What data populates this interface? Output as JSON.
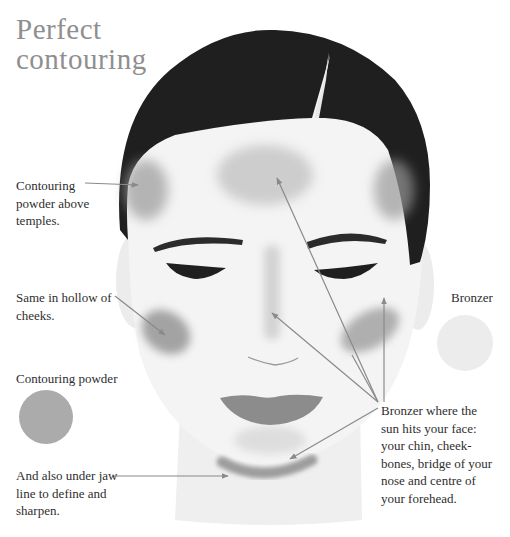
{
  "title": {
    "line1": "Perfect",
    "line2": "contouring"
  },
  "labels": {
    "temples": [
      "Contouring",
      "powder above",
      "temples."
    ],
    "cheeks": [
      "Same in hollow of",
      "cheeks."
    ],
    "contouring_swatch": "Contouring powder",
    "jaw": [
      "And also under jaw",
      "line to define and",
      "sharpen."
    ],
    "bronzer_swatch": "Bronzer",
    "bronzer_areas": [
      "Bronzer where the",
      "sun hits your face:",
      "your chin, cheek-",
      "bones, bridge of your",
      "nose and centre of",
      "your forehead."
    ]
  },
  "colors": {
    "hair": "#1f1f1f",
    "skin": "#f2f2f2",
    "contour": "#9a9a9a",
    "bronzer": "#d4d4d4",
    "lips": "#8c8c8c",
    "pointer_line": "#8a8a8a",
    "title": "#8f8f8f"
  },
  "swatches": [
    {
      "name": "Contouring powder",
      "color": "#ababab"
    },
    {
      "name": "Bronzer",
      "color": "#ececec"
    }
  ]
}
